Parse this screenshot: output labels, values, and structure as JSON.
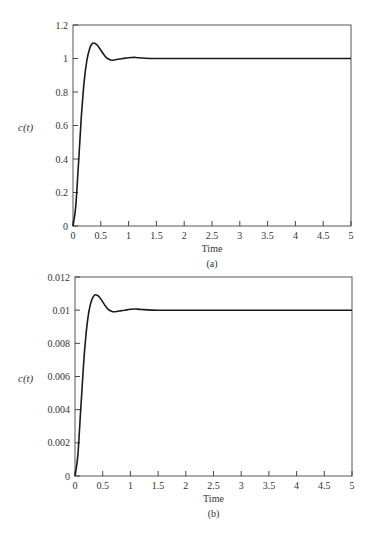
{
  "chart_data": [
    {
      "type": "line",
      "panel": "(a)",
      "xlabel": "Time",
      "ylabel": "c(t)",
      "caption": "(a)",
      "xlim": [
        0,
        5
      ],
      "ylim": [
        0,
        1.2
      ],
      "xticks": [
        "0",
        "0.5",
        "1",
        "1.5",
        "2",
        "2.5",
        "3",
        "3.5",
        "4",
        "4.5",
        "5"
      ],
      "yticks": [
        "0",
        "0.2",
        "0.4",
        "0.6",
        "0.8",
        "1",
        "1.2"
      ],
      "grid": false,
      "legend": null,
      "series": [
        {
          "name": "c(t)",
          "x": [
            0,
            0.05,
            0.1,
            0.15,
            0.2,
            0.25,
            0.3,
            0.35,
            0.4,
            0.45,
            0.5,
            0.55,
            0.6,
            0.65,
            0.7,
            0.8,
            0.9,
            1.0,
            1.1,
            1.2,
            1.5,
            2,
            3,
            4,
            5
          ],
          "y": [
            0,
            0.12,
            0.38,
            0.65,
            0.86,
            0.99,
            1.06,
            1.09,
            1.09,
            1.075,
            1.05,
            1.025,
            1.005,
            0.995,
            0.99,
            0.995,
            1.0,
            1.005,
            1.007,
            1.004,
            1.0,
            1.0,
            1.0,
            1.0,
            1.0
          ]
        }
      ]
    },
    {
      "type": "line",
      "panel": "(b)",
      "xlabel": "Time",
      "ylabel": "c(t)",
      "caption": "(b)",
      "xlim": [
        0,
        5
      ],
      "ylim": [
        0,
        0.012
      ],
      "xticks": [
        "0",
        "0.5",
        "1",
        "1.5",
        "2",
        "2.5",
        "3",
        "3.5",
        "4",
        "4.5",
        "5"
      ],
      "yticks": [
        "0",
        "0.002",
        "0.004",
        "0.006",
        "0.008",
        "0.01",
        "0.012"
      ],
      "grid": false,
      "legend": null,
      "series": [
        {
          "name": "c(t)",
          "x": [
            0,
            0.05,
            0.1,
            0.15,
            0.2,
            0.25,
            0.3,
            0.35,
            0.4,
            0.45,
            0.5,
            0.55,
            0.6,
            0.65,
            0.7,
            0.8,
            0.9,
            1.0,
            1.1,
            1.2,
            1.5,
            2,
            3,
            4,
            5
          ],
          "y": [
            0,
            0.0012,
            0.0038,
            0.0065,
            0.0086,
            0.0099,
            0.0106,
            0.0109,
            0.0109,
            0.01075,
            0.0105,
            0.01025,
            0.01005,
            0.00995,
            0.0099,
            0.00995,
            0.01,
            0.01005,
            0.01007,
            0.01004,
            0.01,
            0.01,
            0.01,
            0.01,
            0.01
          ]
        }
      ]
    }
  ],
  "style": {
    "line_color": "#1a1a1a",
    "axis_color": "#444444",
    "background": "#ffffff"
  }
}
